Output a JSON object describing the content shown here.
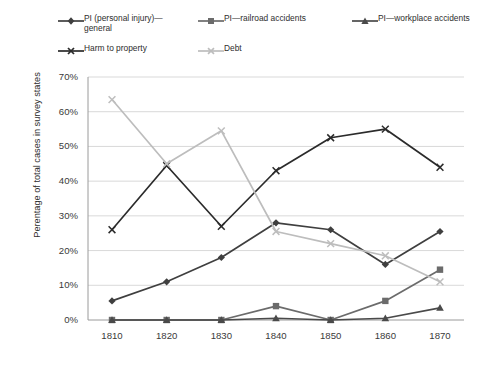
{
  "chart_data": {
    "type": "line",
    "title": "",
    "subtitle": "",
    "xlabel": "",
    "ylabel": "Perentage of total cases in survey states",
    "categories": [
      "1810",
      "1820",
      "1830",
      "1840",
      "1850",
      "1860",
      "1870"
    ],
    "x": [
      1810,
      1820,
      1830,
      1840,
      1850,
      1860,
      1870
    ],
    "xlim": [
      1810,
      1870
    ],
    "ylim": [
      0,
      70
    ],
    "yticks": [
      "0%",
      "10%",
      "20%",
      "30%",
      "40%",
      "50%",
      "60%",
      "70%"
    ],
    "ytick_values": [
      0,
      10,
      20,
      30,
      40,
      50,
      60,
      70
    ],
    "grid": "horizontal",
    "legend_position": "top",
    "series": [
      {
        "name": "PI (personal injury)—general",
        "marker": "diamond",
        "color": "#3f3f3f",
        "values": [
          5.5,
          11.0,
          18.0,
          28.0,
          26.0,
          16.0,
          25.5
        ]
      },
      {
        "name": "PI—railroad accidents",
        "marker": "square",
        "color": "#6b6b6b",
        "values": [
          0.0,
          0.0,
          0.0,
          4.0,
          0.0,
          5.5,
          14.5
        ]
      },
      {
        "name": "PI—workplace accidents",
        "marker": "triangle",
        "color": "#4a4a4a",
        "values": [
          0.0,
          0.0,
          0.0,
          0.5,
          0.0,
          0.5,
          3.5
        ]
      },
      {
        "name": "Harm to property",
        "marker": "x",
        "color": "#2b2b2b",
        "values": [
          26.0,
          44.5,
          27.0,
          43.0,
          52.5,
          55.0,
          44.0
        ]
      },
      {
        "name": "Debt",
        "marker": "x",
        "color": "#bdbdbd",
        "values": [
          63.5,
          45.0,
          54.5,
          25.5,
          22.0,
          18.5,
          11.0
        ]
      }
    ]
  },
  "legend": {
    "items": [
      {
        "label": "PI (personal injury)—\ngeneral",
        "marker": "diamond",
        "color": "#3f3f3f"
      },
      {
        "label": "PI—railroad accidents",
        "marker": "square",
        "color": "#6b6b6b"
      },
      {
        "label": "PI—workplace accidents",
        "marker": "triangle",
        "color": "#4a4a4a"
      },
      {
        "label": "Harm to property",
        "marker": "x",
        "color": "#2b2b2b"
      },
      {
        "label": "Debt",
        "marker": "x",
        "color": "#bdbdbd"
      }
    ]
  },
  "axes": {
    "y_title": "Perentage of total cases in survey states",
    "y_ticks": [
      "70%",
      "60%",
      "50%",
      "40%",
      "30%",
      "20%",
      "10%",
      "0%"
    ],
    "x_ticks": [
      "1810",
      "1820",
      "1830",
      "1840",
      "1850",
      "1860",
      "1870"
    ]
  },
  "colors": {
    "grid": "#d9d9d9",
    "axis": "#9a9a9a",
    "text": "#3a3a3a",
    "background": "#ffffff"
  }
}
